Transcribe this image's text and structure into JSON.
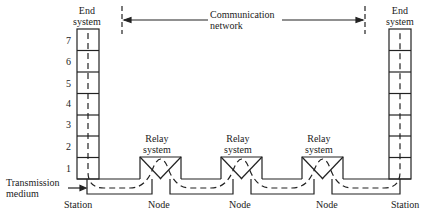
{
  "diagram": {
    "type": "protocol-layer-relay-diagram",
    "end_system_left": {
      "label_line1": "End",
      "label_line2": "system"
    },
    "end_system_right": {
      "label_line1": "End",
      "label_line2": "system"
    },
    "network": {
      "label_line1": "Communication",
      "label_line2": "network"
    },
    "layers": [
      "7",
      "6",
      "5",
      "4",
      "3",
      "2",
      "1"
    ],
    "relays": [
      {
        "label_line1": "Relay",
        "label_line2": "system"
      },
      {
        "label_line1": "Relay",
        "label_line2": "system"
      },
      {
        "label_line1": "Relay",
        "label_line2": "system"
      }
    ],
    "medium": {
      "label_line1": "Transmission",
      "label_line2": "medium"
    },
    "bottom_labels": [
      "Station",
      "Node",
      "Node",
      "Node",
      "Station"
    ],
    "colors": {
      "line": "#222222",
      "background": "#ffffff"
    }
  }
}
